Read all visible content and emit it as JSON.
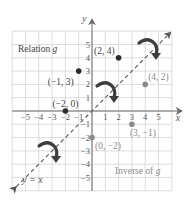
{
  "chart_data": {
    "type": "scatter",
    "title": "",
    "xlabel": "x",
    "ylabel": "y",
    "xlim": [
      -6,
      6
    ],
    "ylim": [
      -6,
      6
    ],
    "grid": true,
    "x_ticks": [
      -5,
      -4,
      -3,
      -2,
      -1,
      1,
      2,
      3,
      4,
      5
    ],
    "y_ticks": [
      -5,
      -4,
      -3,
      -2,
      -1,
      1,
      2,
      3,
      4,
      5
    ],
    "x_tick_labels": [
      "−5",
      "−4",
      "−3",
      "−2",
      "−1",
      "1",
      "2",
      "3",
      "4",
      "5"
    ],
    "y_tick_labels": [
      "−5",
      "−4",
      "−3",
      "−2",
      "−1",
      "1",
      "2",
      "3",
      "4",
      "5"
    ],
    "series": [
      {
        "name": "Relation g",
        "color": "#2b2b2b",
        "points": [
          {
            "x": -1,
            "y": 3,
            "label": "(−1, 3)"
          },
          {
            "x": 2,
            "y": 4,
            "label": "(2, 4)"
          },
          {
            "x": -2,
            "y": 0,
            "label": "(−2, 0)"
          }
        ]
      },
      {
        "name": "Inverse of g",
        "color": "#8a8a8a",
        "points": [
          {
            "x": 3,
            "y": -1,
            "label": "(3, −1)"
          },
          {
            "x": 4,
            "y": 2,
            "label": "(4, 2)"
          },
          {
            "x": 0,
            "y": -2,
            "label": "(0, −2)"
          }
        ]
      }
    ],
    "reference_line": {
      "equation": "y = x",
      "style": "dashed",
      "label": "y = x"
    },
    "annotations": [
      {
        "text": "Relation g",
        "x": -5.3,
        "y": 4.3
      },
      {
        "text": "Inverse of g",
        "x": 1.7,
        "y": -4.5
      },
      {
        "type": "curved-arrow",
        "from": [
          2,
          4
        ],
        "to": [
          4,
          2
        ],
        "label": "reflect"
      },
      {
        "type": "curved-arrow",
        "from": [
          -1,
          3
        ],
        "to": [
          3,
          -1
        ],
        "label": "reflect"
      },
      {
        "type": "curved-arrow",
        "from": [
          -2,
          0
        ],
        "to": [
          0,
          -2
        ],
        "label": "reflect"
      }
    ],
    "legend": null
  },
  "labels": {
    "relation": "Relation g",
    "inverse": "Inverse of g",
    "line": "y = x",
    "x_axis": "x",
    "y_axis": "y"
  }
}
